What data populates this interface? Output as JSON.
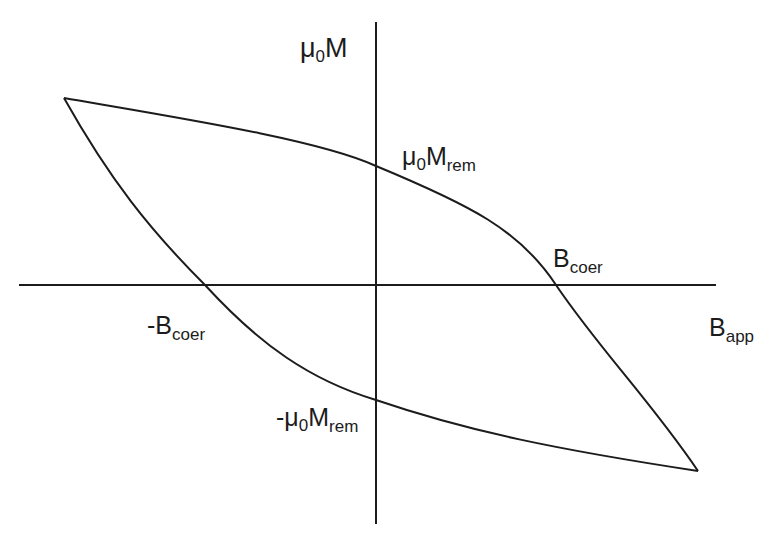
{
  "diagram": {
    "stroke_color": "#1c1c1c",
    "background": "#ffffff",
    "axes": {
      "x_axis": {
        "x1": 19,
        "x2": 716,
        "y": 285
      },
      "y_axis": {
        "x": 376,
        "y1": 22,
        "y2": 524
      }
    },
    "labels": {
      "y_axis": {
        "main": "μ",
        "sub0": "0",
        "tail": "M",
        "sub": ""
      },
      "remanence_pos": {
        "main": "μ",
        "sub0": "0",
        "tail": "M",
        "sub": "rem"
      },
      "remanence_neg": {
        "main": "-μ",
        "sub0": "0",
        "tail": "M",
        "sub": "rem"
      },
      "coercive_pos": {
        "main": "B",
        "sub": "coer"
      },
      "coercive_neg": {
        "main": "-B",
        "sub": "coer"
      },
      "x_axis": {
        "main": "B",
        "sub": "app"
      }
    },
    "key_points": {
      "left_tip": [
        64,
        98
      ],
      "right_tip": [
        698,
        471
      ],
      "upper_branch_y_intercept": [
        376,
        166
      ],
      "lower_branch_y_intercept": [
        376,
        400
      ],
      "upper_branch_x_intercept": [
        556,
        285
      ],
      "lower_branch_x_intercept": [
        205,
        285
      ]
    }
  },
  "paths": {
    "upper_branch": "M64,98 C180,118 320,140 376,166 C470,205 520,230 556,285 C600,350 650,400 698,471",
    "lower_branch": "M64,98 C110,180 150,230 205,285 C260,345 310,380 376,400 C470,432 560,450 698,471"
  }
}
